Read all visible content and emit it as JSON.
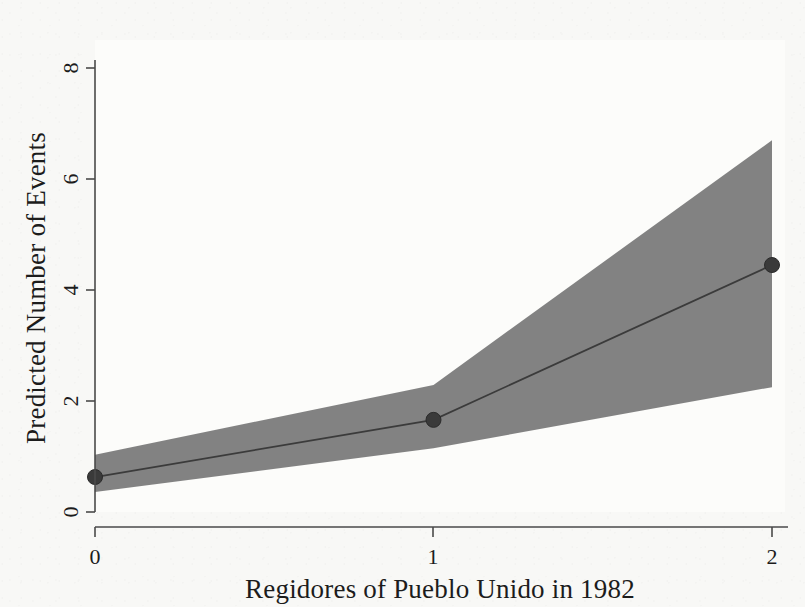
{
  "chart_data": {
    "type": "line",
    "title": "",
    "subtitle": "",
    "xlabel": "Regidores of Pueblo Unido in 1982",
    "ylabel": "Predicted Number of Events",
    "xlim": [
      0,
      2
    ],
    "ylim": [
      0,
      8.6
    ],
    "xticks": [
      0,
      1,
      2
    ],
    "xtick_labels": [
      "0",
      "1",
      "2"
    ],
    "yticks": [
      0,
      2,
      4,
      6,
      8
    ],
    "ytick_labels": [
      "0",
      "2",
      "4",
      "6",
      "8"
    ],
    "grid": false,
    "legend": null,
    "legend_position": "none",
    "x": [
      0,
      1,
      2
    ],
    "series": [
      {
        "name": "Predicted number of events",
        "kind": "line-with-markers",
        "values": [
          0.63,
          1.66,
          4.45
        ],
        "color": "#3a3a3a",
        "marker": "circle"
      },
      {
        "name": "Confidence interval lower bound",
        "kind": "band-lower",
        "values": [
          0.36,
          1.15,
          2.25
        ],
        "color": "#7b7b7b"
      },
      {
        "name": "Confidence interval upper bound",
        "kind": "band-upper",
        "values": [
          1.03,
          2.29,
          6.7
        ],
        "color": "#7b7b7b"
      }
    ],
    "annotations": [],
    "band_color": "#7b7b7b",
    "line_color": "#3a3a3a",
    "background_color": "#f8f8f6"
  },
  "axes": {
    "x_title": "Regidores of Pueblo Unido in 1982",
    "y_title": "Predicted Number of Events",
    "x_tick_0": "0",
    "x_tick_1": "1",
    "x_tick_2": "2",
    "y_tick_0": "0",
    "y_tick_2": "2",
    "y_tick_4": "4",
    "y_tick_6": "6",
    "y_tick_8": "8"
  }
}
